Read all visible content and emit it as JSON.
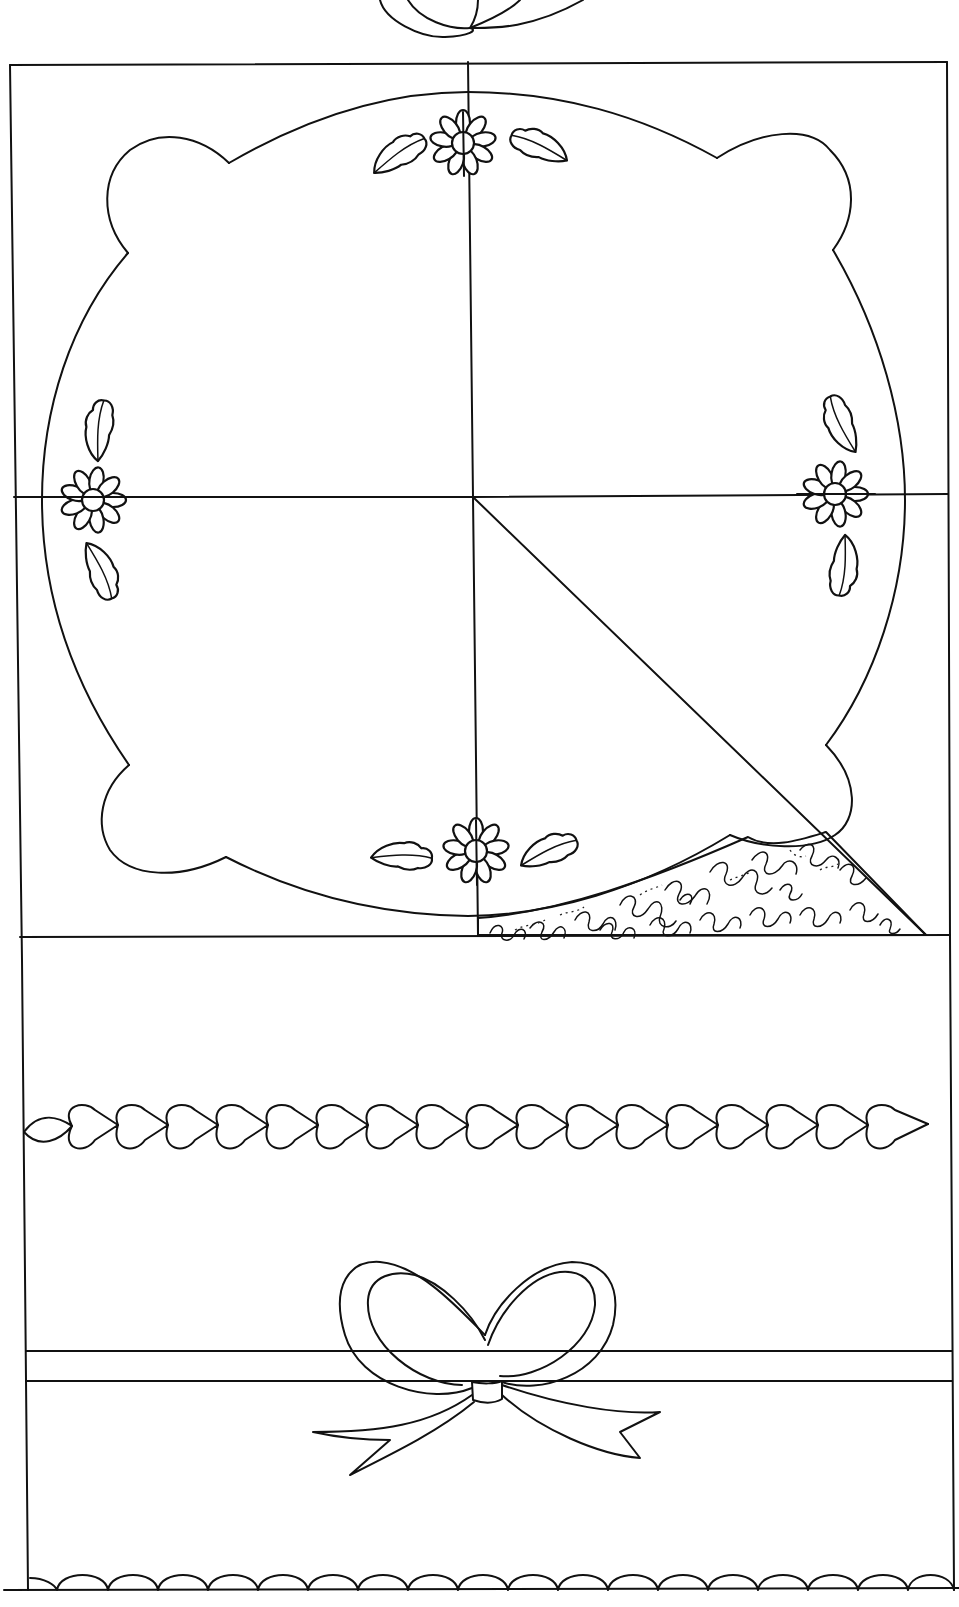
{
  "figure": {
    "title": "Quilt block pattern with scalloped medallion, daisies, hearts border and bow",
    "ink_color": "#111111",
    "paper_color": "#ffffff"
  },
  "elements": {
    "top_bow_fragment": "Bow loops (partial, from previous block)",
    "frame": "Outer block frame",
    "medallion": "Scalloped oval medallion with quartering guide lines",
    "daisies": [
      {
        "position": "top",
        "leaves": 2
      },
      {
        "position": "left",
        "leaves": 2
      },
      {
        "position": "right",
        "leaves": 2
      },
      {
        "position": "bottom",
        "leaves": 2
      }
    ],
    "diagonal_guide": "Diagonal line from center to lower-right corner",
    "stipple_fill": "Meander stipple quilting in lower-right wedge",
    "hearts_border": {
      "label": "Chain of hearts border",
      "count": 19
    },
    "band_lines": "Two horizontal band lines behind bow",
    "bow": "Ribbon bow with two loops and two tails",
    "scallop_border": {
      "label": "Scalloped bottom edge",
      "count": 19
    }
  }
}
